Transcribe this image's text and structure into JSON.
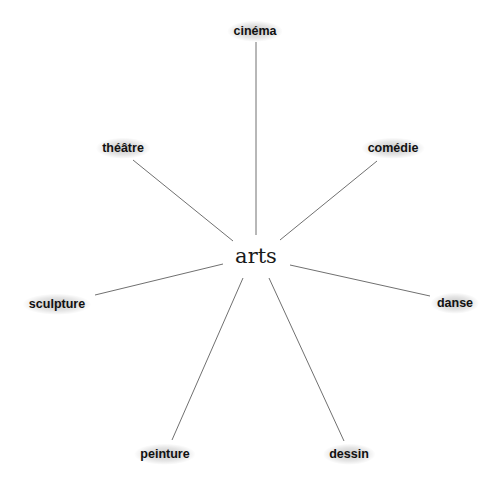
{
  "diagram": {
    "type": "mind-map",
    "center": {
      "label": "arts",
      "x": 256,
      "y": 256
    },
    "nodes": [
      {
        "label": "cinéma",
        "x": 255,
        "y": 31,
        "line": [
          256,
          42,
          256,
          235
        ]
      },
      {
        "label": "comédie",
        "x": 393,
        "y": 148,
        "line": [
          377,
          161,
          280,
          240
        ]
      },
      {
        "label": "théâtre",
        "x": 123,
        "y": 148,
        "line": [
          133,
          160,
          233,
          241
        ]
      },
      {
        "label": "danse",
        "x": 455,
        "y": 303,
        "line": [
          430,
          296,
          290,
          265
        ]
      },
      {
        "label": "sculpture",
        "x": 57,
        "y": 304,
        "line": [
          95,
          295,
          223,
          264
        ]
      },
      {
        "label": "peinture",
        "x": 165,
        "y": 454,
        "line": [
          172,
          440,
          243,
          278
        ]
      },
      {
        "label": "dessin",
        "x": 349,
        "y": 454,
        "line": [
          344,
          441,
          269,
          278
        ]
      }
    ],
    "colors": {
      "line": "#707070",
      "text": "#111111",
      "background": "#ffffff"
    }
  }
}
